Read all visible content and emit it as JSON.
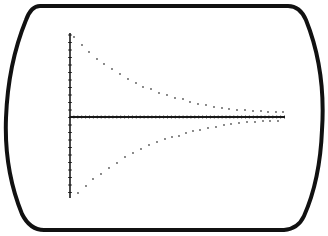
{
  "colors": {
    "background": "#ffffff",
    "frame": "#111111",
    "axis": "#1a1a1a",
    "dots": "#555555"
  },
  "frame": {
    "shape": "crt-screen-barrel",
    "bounds": {
      "left": 5,
      "top": 5,
      "right": 323,
      "bottom": 231
    }
  },
  "axes": {
    "origin_px": [
      70,
      117
    ],
    "y_axis_px": {
      "x": 70,
      "top": 33,
      "bottom": 198,
      "tick_spacing": 7.5
    },
    "x_axis_px": {
      "y": 117,
      "left": 70,
      "right": 285,
      "tick_spacing": 3.9
    }
  },
  "chart_data": {
    "type": "scatter",
    "title": "",
    "xlabel": "",
    "ylabel": "",
    "grid": false,
    "legend": null,
    "xlim": [
      0,
      28
    ],
    "ylim": [
      -1,
      1
    ],
    "series": [
      {
        "name": "upper envelope",
        "x": [
          0.5,
          1.5,
          2.5,
          3.5,
          4.5,
          5.5,
          6.5,
          7.5,
          8.5,
          9.5,
          10.5,
          11.5,
          12.5,
          13.5,
          14.5,
          15.5,
          16.5,
          17.5,
          18.5,
          19.5,
          20.5,
          21.5,
          22.5,
          23.5,
          24.5,
          25.5,
          26.5,
          27.5
        ],
        "values": [
          0.94,
          0.84,
          0.76,
          0.68,
          0.62,
          0.56,
          0.51,
          0.45,
          0.4,
          0.35,
          0.33,
          0.28,
          0.26,
          0.22,
          0.21,
          0.18,
          0.16,
          0.14,
          0.12,
          0.11,
          0.1,
          0.08,
          0.08,
          0.07,
          0.07,
          0.06,
          0.06,
          0.06
        ]
      },
      {
        "name": "lower envelope",
        "x": [
          1,
          2,
          3,
          4,
          5,
          6,
          7,
          8,
          9,
          10,
          11,
          12,
          13,
          14,
          15,
          16,
          17,
          18,
          19,
          20,
          21,
          22,
          23,
          24,
          25,
          26,
          27
        ],
        "values": [
          -0.93,
          -0.84,
          -0.76,
          -0.7,
          -0.62,
          -0.56,
          -0.49,
          -0.44,
          -0.39,
          -0.34,
          -0.3,
          -0.27,
          -0.23,
          -0.21,
          -0.19,
          -0.17,
          -0.15,
          -0.13,
          -0.12,
          -0.1,
          -0.09,
          -0.07,
          -0.06,
          -0.06,
          -0.05,
          -0.05,
          -0.05
        ]
      }
    ],
    "upper_dots_px": [
      [
        74,
        37
      ],
      [
        82,
        45
      ],
      [
        89,
        52
      ],
      [
        97,
        59
      ],
      [
        104,
        64
      ],
      [
        112,
        69
      ],
      [
        120,
        74
      ],
      [
        128,
        79
      ],
      [
        136,
        83
      ],
      [
        143,
        87
      ],
      [
        151,
        89
      ],
      [
        159,
        93
      ],
      [
        167,
        95
      ],
      [
        175,
        98
      ],
      [
        183,
        99
      ],
      [
        190,
        102
      ],
      [
        198,
        104
      ],
      [
        206,
        105
      ],
      [
        214,
        107
      ],
      [
        222,
        108
      ],
      [
        229,
        109
      ],
      [
        237,
        110
      ],
      [
        245,
        110
      ],
      [
        253,
        111
      ],
      [
        261,
        111
      ],
      [
        268,
        112
      ],
      [
        276,
        112
      ],
      [
        283,
        112
      ]
    ],
    "lower_dots_px": [
      [
        78,
        193
      ],
      [
        86,
        186
      ],
      [
        93,
        179
      ],
      [
        101,
        174
      ],
      [
        109,
        168
      ],
      [
        117,
        163
      ],
      [
        125,
        157
      ],
      [
        133,
        153
      ],
      [
        141,
        149
      ],
      [
        149,
        145
      ],
      [
        157,
        142
      ],
      [
        165,
        139
      ],
      [
        172,
        137
      ],
      [
        179,
        136
      ],
      [
        186,
        133
      ],
      [
        193,
        131
      ],
      [
        200,
        130
      ],
      [
        208,
        128
      ],
      [
        216,
        127
      ],
      [
        224,
        125
      ],
      [
        231,
        124
      ],
      [
        239,
        123
      ],
      [
        247,
        122
      ],
      [
        255,
        122
      ],
      [
        263,
        121
      ],
      [
        270,
        121
      ],
      [
        278,
        121
      ]
    ]
  }
}
